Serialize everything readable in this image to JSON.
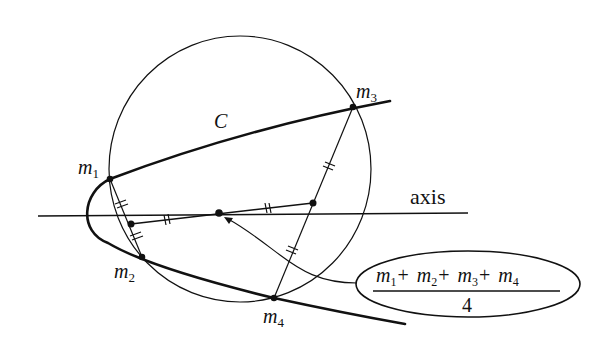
{
  "diagram": {
    "curve_label": "C",
    "axis_label": "axis",
    "points": [
      {
        "name": "m1",
        "base": "m",
        "sub": "1"
      },
      {
        "name": "m2",
        "base": "m",
        "sub": "2"
      },
      {
        "name": "m3",
        "base": "m",
        "sub": "3"
      },
      {
        "name": "m4",
        "base": "m",
        "sub": "4"
      }
    ],
    "formula": {
      "numerator_terms": [
        {
          "base": "m",
          "sub": "1"
        },
        {
          "base": "m",
          "sub": "2"
        },
        {
          "base": "m",
          "sub": "3"
        },
        {
          "base": "m",
          "sub": "4"
        }
      ],
      "operator": "+",
      "denominator": "4"
    },
    "colors": {
      "ink": "#111111",
      "background": "#ffffff"
    }
  }
}
